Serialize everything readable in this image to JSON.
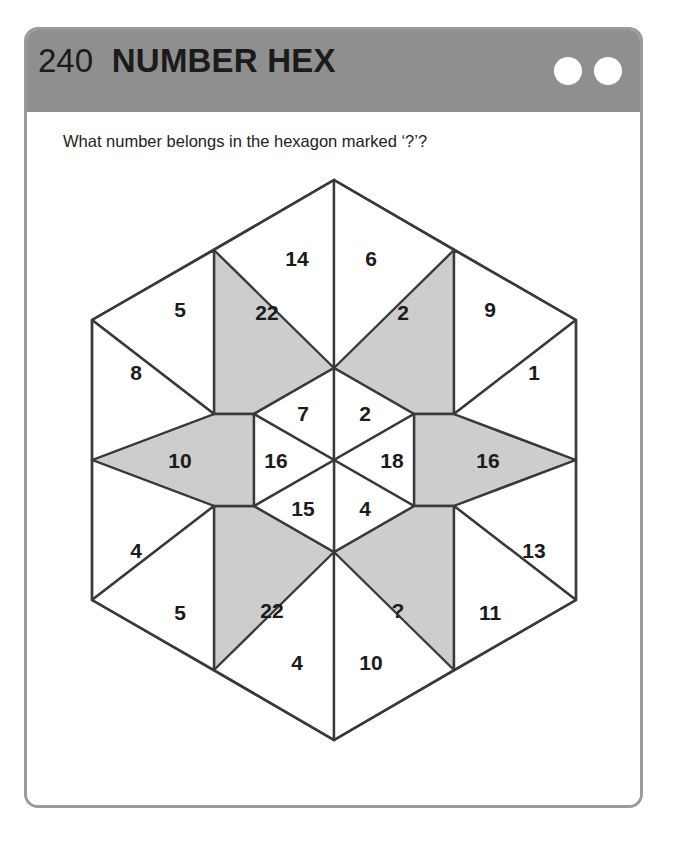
{
  "header": {
    "number": "240",
    "title": "NUMBER HEX",
    "dots": [
      "circle-1",
      "circle-2"
    ]
  },
  "question": "What number belongs in the hexagon marked ‘?’?",
  "colors": {
    "header_bg": "#8f8f8f",
    "card_border": "#9a9a9a",
    "shaded_cell": "#cdcdcd",
    "plain_cell": "#ffffff",
    "stroke": "#3a3a3a",
    "text": "#1b1b1b"
  },
  "puzzle": {
    "type": "hexagon-grid",
    "center_hexagon": {
      "label": "inner-hexagon",
      "fill": "plain",
      "segments": [
        {
          "position": "top-left",
          "value": "7"
        },
        {
          "position": "top-right",
          "value": "2"
        },
        {
          "position": "right",
          "value": "18"
        },
        {
          "position": "bottom-right",
          "value": "4"
        },
        {
          "position": "bottom-left",
          "value": "15"
        },
        {
          "position": "left",
          "value": "16"
        }
      ]
    },
    "shaded_ring": [
      {
        "position": "upper-left",
        "value": "22",
        "fill": "shaded"
      },
      {
        "position": "upper-right",
        "value": "2",
        "fill": "shaded"
      },
      {
        "position": "right",
        "value": "16",
        "fill": "shaded"
      },
      {
        "position": "lower-right",
        "value": "?",
        "fill": "shaded"
      },
      {
        "position": "lower-left",
        "value": "22",
        "fill": "shaded"
      },
      {
        "position": "left",
        "value": "10",
        "fill": "shaded"
      }
    ],
    "outer_triangles": [
      {
        "position": "top-left",
        "value": "14",
        "fill": "plain"
      },
      {
        "position": "top-right",
        "value": "6",
        "fill": "plain"
      },
      {
        "position": "upper-right-upper",
        "value": "9",
        "fill": "plain"
      },
      {
        "position": "upper-right-lower",
        "value": "1",
        "fill": "plain"
      },
      {
        "position": "lower-right-upper",
        "value": "13",
        "fill": "plain"
      },
      {
        "position": "lower-right-lower",
        "value": "11",
        "fill": "plain"
      },
      {
        "position": "bottom-left",
        "value": "4",
        "fill": "plain"
      },
      {
        "position": "bottom-right",
        "value": "10",
        "fill": "plain"
      },
      {
        "position": "lower-left-lower",
        "value": "5",
        "fill": "plain"
      },
      {
        "position": "lower-left-upper",
        "value": "4",
        "fill": "plain"
      },
      {
        "position": "upper-left-lower",
        "value": "8",
        "fill": "plain"
      },
      {
        "position": "upper-left-upper",
        "value": "5",
        "fill": "plain"
      }
    ],
    "missing_marker": "?"
  }
}
